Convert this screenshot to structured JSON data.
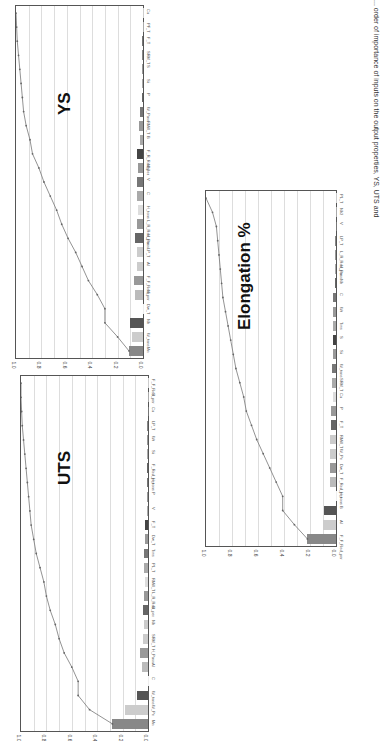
{
  "caption": "... order of importance of inputs on the output properties, YS, UTS and",
  "chart_data": [
    {
      "type": "bar",
      "title": "YS",
      "orientation": "rotated-90",
      "yticks": [
        "1.0",
        "0.8",
        "0.6",
        "0.4",
        "0.2",
        "0.0"
      ],
      "ylim": [
        0,
        1
      ],
      "categories": [
        "Mn",
        "W_tons",
        "Nb",
        "Dw_T",
        "Ni",
        "F_F_Red_per",
        "Al",
        "LP_T",
        "H_Pass",
        "L_R_Red_per",
        "H_tons",
        "C",
        "V",
        "Nb2",
        "F_R_Red_per",
        "B",
        "RMill_T",
        "W_Pass",
        "P",
        "Si",
        "S",
        "SRM_T",
        "F_T",
        "PF_T",
        "Cu"
      ],
      "values": [
        0.11,
        0.09,
        0.1,
        0.0,
        0.06,
        0.07,
        0.05,
        0.05,
        0.06,
        0.05,
        0.04,
        0.05,
        0.05,
        0.04,
        0.05,
        0.02,
        0.03,
        0.02,
        0.01,
        0.01,
        0.01,
        0.01,
        0.01,
        0.0,
        0.0
      ],
      "cumulative": [
        0.11,
        0.2,
        0.3,
        0.3,
        0.36,
        0.43,
        0.48,
        0.53,
        0.59,
        0.64,
        0.68,
        0.73,
        0.78,
        0.82,
        0.87,
        0.89,
        0.92,
        0.94,
        0.95,
        0.96,
        0.97,
        0.98,
        0.99,
        0.995,
        1.0
      ]
    },
    {
      "type": "bar",
      "title": "UTS",
      "orientation": "rotated-90",
      "yticks": [
        "1.0",
        "0.8",
        "0.6",
        "0.4",
        "0.2",
        "0.0"
      ],
      "ylim": [
        0,
        1
      ],
      "categories": [
        "Mn",
        "W_Pe",
        "W_tons",
        "C",
        "Al",
        "H_Pass",
        "SRM_T",
        "Nb",
        "B",
        "L_R_Red_per",
        "RMill_T",
        "PL_T",
        "Tms",
        "Dw_T",
        "F_T",
        "V",
        "P",
        "H_tons",
        "F_Red_per",
        "Si",
        "Wt",
        "LP_T",
        "Cu",
        "S",
        "F_F_Red_per"
      ],
      "values": [
        0.28,
        0.18,
        0.09,
        0.0,
        0.05,
        0.06,
        0.04,
        0.03,
        0.04,
        0.03,
        0.02,
        0.03,
        0.03,
        0.02,
        0.02,
        0.01,
        0.01,
        0.01,
        0.01,
        0.01,
        0.01,
        0.01,
        0.0,
        0.0,
        0.0
      ],
      "cumulative": [
        0.28,
        0.46,
        0.55,
        0.55,
        0.6,
        0.66,
        0.7,
        0.73,
        0.77,
        0.8,
        0.82,
        0.85,
        0.88,
        0.9,
        0.92,
        0.93,
        0.94,
        0.95,
        0.96,
        0.97,
        0.98,
        0.99,
        0.995,
        1.0,
        1.0
      ]
    },
    {
      "type": "bar",
      "title": "Elongation %",
      "orientation": "rotated-90",
      "yticks": [
        "1.0",
        "0.8",
        "0.6",
        "0.4",
        "0.2",
        "0.0"
      ],
      "ylim": [
        0,
        1
      ],
      "categories": [
        "F_F_Red_per",
        "Al",
        "B",
        "H_tons",
        "F_Red_per",
        "Dw_T",
        "W_Pe",
        "RMill_T",
        "F_T",
        "P",
        "Cu",
        "SRM_T",
        "W_tons",
        "Si",
        "S",
        "Tms",
        "Wt",
        "C",
        "Nb",
        "H_Pass",
        "L_R_Red_per",
        "LP_T",
        "V",
        "Nb2",
        "PL_T"
      ],
      "values": [
        0.22,
        0.1,
        0.09,
        0.0,
        0.05,
        0.05,
        0.05,
        0.05,
        0.04,
        0.04,
        0.02,
        0.03,
        0.03,
        0.02,
        0.02,
        0.02,
        0.02,
        0.02,
        0.01,
        0.01,
        0.01,
        0.01,
        0.0,
        0.0,
        0.0
      ],
      "cumulative": [
        0.22,
        0.32,
        0.41,
        0.41,
        0.46,
        0.51,
        0.56,
        0.61,
        0.65,
        0.69,
        0.71,
        0.74,
        0.77,
        0.79,
        0.81,
        0.83,
        0.85,
        0.87,
        0.88,
        0.89,
        0.9,
        0.91,
        0.92,
        0.95,
        1.0
      ]
    }
  ]
}
